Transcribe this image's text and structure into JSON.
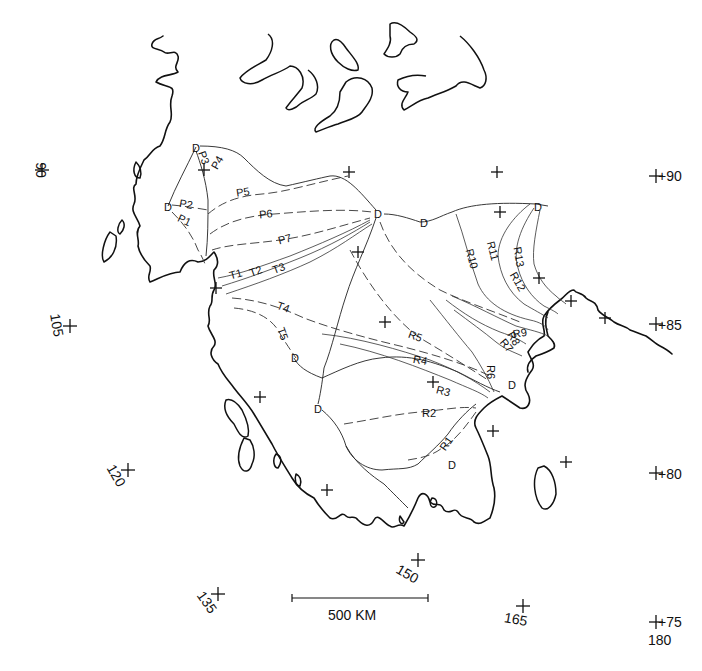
{
  "header": {
    "text": ""
  },
  "scale_bar": {
    "label": "500 KM"
  },
  "graticule": [
    {
      "id": "lat90-left",
      "label": "90",
      "x": 42,
      "y": 170,
      "rot": 90,
      "tx": 36,
      "ty": 170
    },
    {
      "id": "lat90-right",
      "label": "+90",
      "x": 656,
      "y": 176,
      "rot": 0,
      "tx": 638,
      "ty": 181
    },
    {
      "id": "lon105",
      "label": "105",
      "x": 70,
      "y": 326,
      "rot": 80,
      "tx": 52,
      "ty": 326
    },
    {
      "id": "lat85-right",
      "label": "+85",
      "x": 656,
      "y": 324,
      "rot": 0,
      "tx": 638,
      "ty": 330
    },
    {
      "id": "lon120",
      "label": "120",
      "x": 128,
      "y": 470,
      "rot": 60,
      "tx": 112,
      "ty": 478
    },
    {
      "id": "lat80-right",
      "label": "+80",
      "x": 656,
      "y": 473,
      "rot": 0,
      "tx": 638,
      "ty": 479
    },
    {
      "id": "lon150",
      "label": "150",
      "x": 418,
      "y": 560,
      "rot": 30,
      "tx": 405,
      "ty": 578
    },
    {
      "id": "lon135",
      "label": "135",
      "x": 218,
      "y": 594,
      "rot": 55,
      "tx": 203,
      "ty": 605
    },
    {
      "id": "lon165",
      "label": "165",
      "x": 523,
      "y": 606,
      "rot": 10,
      "tx": 515,
      "ty": 624
    },
    {
      "id": "lat75-right",
      "label": "+75",
      "x": 656,
      "y": 622,
      "rot": 0,
      "tx": 638,
      "ty": 627
    },
    {
      "id": "lon180",
      "label": "180",
      "x": 0,
      "y": 0,
      "rot": 0,
      "tx": 628,
      "ty": 645,
      "no_tick": true
    }
  ],
  "grid_ticks": [
    [
      204,
      170
    ],
    [
      349,
      172
    ],
    [
      497,
      172
    ],
    [
      500,
      212
    ],
    [
      358,
      252
    ],
    [
      216,
      288
    ],
    [
      385,
      322
    ],
    [
      539,
      278
    ],
    [
      571,
      301
    ],
    [
      605,
      318
    ],
    [
      433,
      382
    ],
    [
      260,
      397
    ],
    [
      493,
      431
    ],
    [
      566,
      462
    ],
    [
      327,
      490
    ]
  ],
  "divide_labels": [
    {
      "id": "d1",
      "label": "D",
      "x": 196,
      "y": 149
    },
    {
      "id": "d2",
      "label": "D",
      "x": 168,
      "y": 208
    },
    {
      "id": "d3",
      "label": "D",
      "x": 378,
      "y": 215
    },
    {
      "id": "d4",
      "label": "D",
      "x": 424,
      "y": 224
    },
    {
      "id": "d5",
      "label": "D",
      "x": 538,
      "y": 208
    },
    {
      "id": "d6",
      "label": "D",
      "x": 295,
      "y": 359
    },
    {
      "id": "d7",
      "label": "D",
      "x": 318,
      "y": 410
    },
    {
      "id": "d8",
      "label": "D",
      "x": 512,
      "y": 386
    },
    {
      "id": "d9",
      "label": "D",
      "x": 452,
      "y": 466
    }
  ],
  "profiles": [
    {
      "id": "P1",
      "label": "P1",
      "x": 184,
      "y": 221,
      "rot": 25
    },
    {
      "id": "P2",
      "label": "P2",
      "x": 186,
      "y": 205,
      "rot": 10
    },
    {
      "id": "P3",
      "label": "P3",
      "x": 203,
      "y": 158,
      "rot": 70
    },
    {
      "id": "P4",
      "label": "P4",
      "x": 218,
      "y": 163,
      "rot": -60
    },
    {
      "id": "P5",
      "label": "P5",
      "x": 243,
      "y": 193,
      "rot": -8
    },
    {
      "id": "P6",
      "label": "P6",
      "x": 266,
      "y": 215,
      "rot": -5
    },
    {
      "id": "P7",
      "label": "P7",
      "x": 285,
      "y": 240,
      "rot": -15
    },
    {
      "id": "T1",
      "label": "T1",
      "x": 236,
      "y": 275,
      "rot": -15
    },
    {
      "id": "T2",
      "label": "T2",
      "x": 256,
      "y": 272,
      "rot": -20
    },
    {
      "id": "T3",
      "label": "T3",
      "x": 279,
      "y": 269,
      "rot": -20
    },
    {
      "id": "T4",
      "label": "T4",
      "x": 283,
      "y": 308,
      "rot": 20
    },
    {
      "id": "T5",
      "label": "T5",
      "x": 282,
      "y": 334,
      "rot": 70
    },
    {
      "id": "R1",
      "label": "R1",
      "x": 447,
      "y": 444,
      "rot": -55
    },
    {
      "id": "R2",
      "label": "R2",
      "x": 429,
      "y": 414,
      "rot": 0
    },
    {
      "id": "R3",
      "label": "R3",
      "x": 443,
      "y": 392,
      "rot": 15
    },
    {
      "id": "R4",
      "label": "R4",
      "x": 420,
      "y": 361,
      "rot": 10
    },
    {
      "id": "R5",
      "label": "R5",
      "x": 415,
      "y": 337,
      "rot": 20
    },
    {
      "id": "R6",
      "label": "R6",
      "x": 490,
      "y": 372,
      "rot": 90
    },
    {
      "id": "R7",
      "label": "R7",
      "x": 506,
      "y": 346,
      "rot": 50
    },
    {
      "id": "R8",
      "label": "R8",
      "x": 513,
      "y": 339,
      "rot": 60
    },
    {
      "id": "R9",
      "label": "R9",
      "x": 520,
      "y": 334,
      "rot": -10
    },
    {
      "id": "R10",
      "label": "R10",
      "x": 471,
      "y": 259,
      "rot": 75
    },
    {
      "id": "R11",
      "label": "R11",
      "x": 492,
      "y": 251,
      "rot": 75
    },
    {
      "id": "R12",
      "label": "R12",
      "x": 517,
      "y": 282,
      "rot": 60
    },
    {
      "id": "R13",
      "label": "R13",
      "x": 518,
      "y": 257,
      "rot": 80
    }
  ]
}
